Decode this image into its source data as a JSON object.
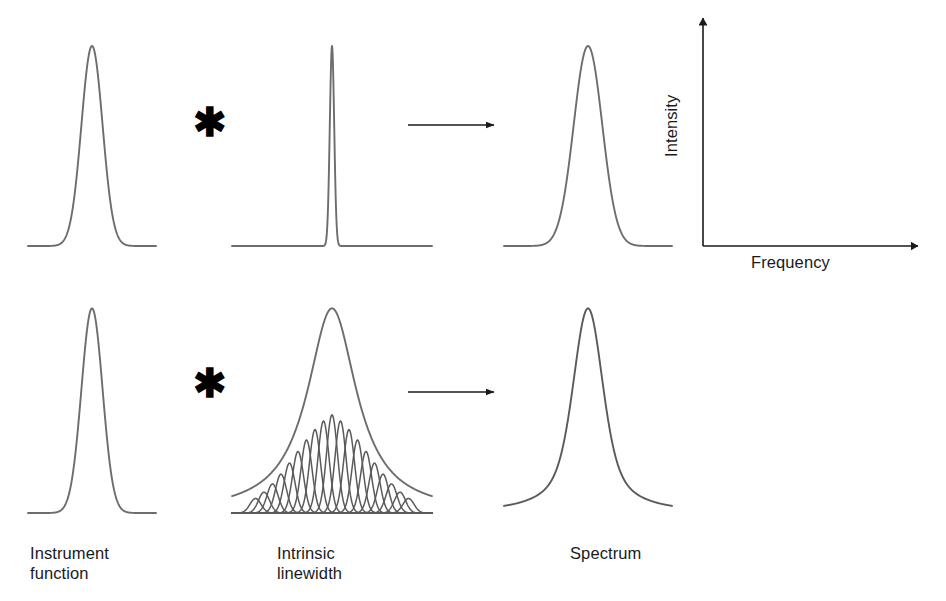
{
  "figure": {
    "width": 946,
    "height": 601,
    "background": "#ffffff",
    "curve_color": "#6d6d6d",
    "curve_color_dark": "#5a5a5a",
    "axis_color": "#1a1a1a",
    "text_color": "#1a1a1a"
  },
  "operators": {
    "convolution_symbol": "✱",
    "arrow_symbol": "→"
  },
  "panels": {
    "instrument_function": {
      "label": "Instrument\nfunction"
    },
    "intrinsic_linewidth": {
      "label": "Intrinsic\nlinewidth"
    },
    "spectrum": {
      "label": "Spectrum"
    }
  },
  "axes": {
    "x_label": "Frequency",
    "y_label": "Intensity"
  },
  "chart_data": {
    "type": "line",
    "title": "",
    "xlabel": "Frequency",
    "ylabel": "Intensity",
    "grid": false,
    "legend": "none",
    "rows": [
      {
        "name": "narrow-linewidth-row",
        "panels": [
          {
            "name": "instrument-function-top",
            "shape": "gaussian",
            "amplitude": 1.0,
            "center": 0.0,
            "sigma": 0.165,
            "xlim": [
              -1,
              1
            ],
            "ylim": [
              0,
              1.08
            ]
          },
          {
            "name": "intrinsic-linewidth-top",
            "shape": "gaussian",
            "amplitude": 1.0,
            "center": 0.0,
            "sigma": 0.022,
            "xlim": [
              -1,
              1
            ],
            "ylim": [
              0,
              1.08
            ]
          },
          {
            "name": "spectrum-top",
            "shape": "gaussian",
            "amplitude": 1.0,
            "center": 0.0,
            "sigma": 0.17,
            "xlim": [
              -1,
              1
            ],
            "ylim": [
              0,
              1.08
            ]
          }
        ]
      },
      {
        "name": "broad-linewidth-row",
        "panels": [
          {
            "name": "instrument-function-bottom",
            "shape": "gaussian",
            "amplitude": 1.0,
            "center": 0.0,
            "sigma": 0.165,
            "xlim": [
              -1,
              1
            ],
            "ylim": [
              0,
              1.08
            ]
          },
          {
            "name": "intrinsic-linewidth-bottom",
            "shape": "envelope-plus-components",
            "envelope": {
              "shape": "lorentzian",
              "amplitude": 1.0,
              "center": 0.0,
              "gamma": 0.3
            },
            "components": {
              "count": 19,
              "shape": "gaussian",
              "sigma": 0.055,
              "spacing": 0.085,
              "envelope_amplitude": 0.52,
              "envelope_sigma": 0.3,
              "centers": [
                -0.765,
                -0.68,
                -0.595,
                -0.51,
                -0.425,
                -0.34,
                -0.255,
                -0.17,
                -0.085,
                0.0,
                0.085,
                0.17,
                0.255,
                0.34,
                0.425,
                0.51,
                0.595,
                0.68,
                0.765
              ],
              "heights": [
                0.071,
                0.102,
                0.142,
                0.19,
                0.244,
                0.301,
                0.357,
                0.408,
                0.45,
                0.48,
                0.45,
                0.408,
                0.357,
                0.301,
                0.244,
                0.19,
                0.142,
                0.102,
                0.071
              ]
            },
            "xlim": [
              -1,
              1
            ],
            "ylim": [
              0,
              1.08
            ]
          },
          {
            "name": "spectrum-bottom",
            "shape": "voigt",
            "amplitude": 1.0,
            "center": 0.0,
            "gaussian_sigma": 0.165,
            "lorentzian_gamma": 0.26,
            "xlim": [
              -1,
              1
            ],
            "ylim": [
              0,
              1.08
            ]
          }
        ]
      }
    ]
  },
  "geometry": {
    "rows": [
      {
        "baseline": 246,
        "top": 30
      },
      {
        "baseline": 513,
        "top": 292
      }
    ],
    "columns": [
      {
        "name": "instrument",
        "x0": 28,
        "x1": 156
      },
      {
        "name": "intrinsic",
        "x0": 232,
        "x1": 432
      },
      {
        "name": "spectrum",
        "x0": 504,
        "x1": 672
      }
    ],
    "plot_axes": {
      "x": 703,
      "y_top": 18,
      "baseline": 246,
      "x_end": 918
    },
    "arrows": [
      {
        "row": 0,
        "x0": 408,
        "x1": 494,
        "y": 125
      },
      {
        "row": 1,
        "x0": 408,
        "x1": 494,
        "y": 392
      }
    ],
    "asterisks": [
      {
        "row": 0,
        "x": 193,
        "y": 102
      },
      {
        "row": 1,
        "x": 193,
        "y": 363
      }
    ],
    "labels": [
      {
        "name": "instrument",
        "x": 30,
        "y": 543
      },
      {
        "name": "intrinsic",
        "x": 277,
        "y": 543
      },
      {
        "name": "spectrum",
        "x": 570,
        "y": 543
      }
    ]
  }
}
